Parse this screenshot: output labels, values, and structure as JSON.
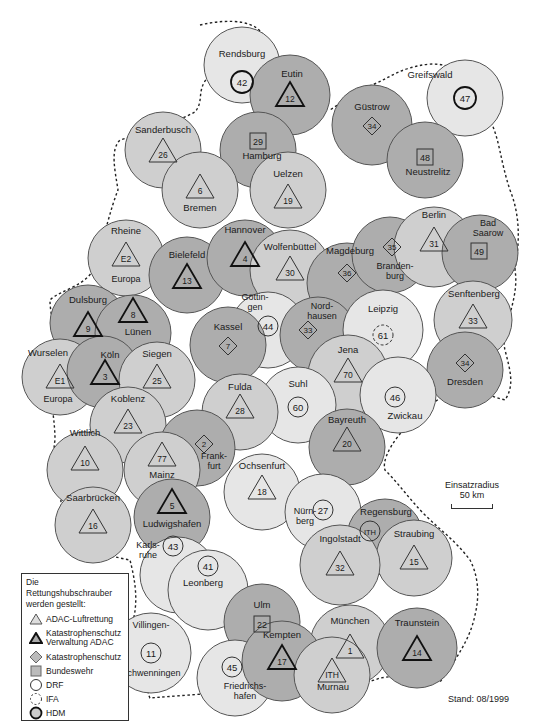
{
  "figure": {
    "title": "Die Rettungshubschrauber werden gestellt:",
    "stand": "Stand: 08/1999",
    "caption": "Figure 1",
    "scale": {
      "label": "Einsatzradius",
      "value": "50 km"
    }
  },
  "colors": {
    "light": "#e6e6e6",
    "medium": "#cfcfcf",
    "dark": "#adadad",
    "stroke": "#555555",
    "border_dashed": "#222222"
  },
  "legend": {
    "title_line1": "Die Rettungshubschrauber",
    "title_line2": "werden gestellt:",
    "items": [
      {
        "symbol": "triangle-thin",
        "label": "ADAC-Luftrettung"
      },
      {
        "symbol": "triangle-bold",
        "label": "Katastrophenschutz Verwaltung ADAC",
        "label1": "Katastrophenschutz",
        "label2": "Verwaltung ADAC"
      },
      {
        "symbol": "diamond",
        "label": "Katastrophenschutz"
      },
      {
        "symbol": "square",
        "label": "Bundeswehr"
      },
      {
        "symbol": "circle",
        "label": "DRF"
      },
      {
        "symbol": "circle-dashed",
        "label": "IFA"
      },
      {
        "symbol": "circle-bold",
        "label": "HDM"
      }
    ]
  },
  "stations": [
    {
      "name": "Rendsburg",
      "id": "42",
      "symbol": "circle-bold",
      "shade": "light",
      "cx": 242,
      "cy": 65,
      "r": 38,
      "lx": 242,
      "ly": 57,
      "sy": 82
    },
    {
      "name": "Eutin",
      "id": "12",
      "symbol": "triangle-bold",
      "shade": "dark",
      "cx": 290,
      "cy": 95,
      "r": 40,
      "lx": 292,
      "ly": 77,
      "sy": 98
    },
    {
      "name": "Hamburg",
      "id": "29",
      "symbol": "square",
      "shade": "dark",
      "cx": 258,
      "cy": 150,
      "r": 38,
      "lx": 262,
      "ly": 159,
      "sy": 141
    },
    {
      "name": "Greifswald",
      "id": "47",
      "symbol": "circle-bold",
      "shade": "light",
      "cx": 465,
      "cy": 98,
      "r": 38,
      "lx": 430,
      "ly": 78,
      "sy": 98,
      "lx2": 430
    },
    {
      "name": "Güstrow",
      "id": "34",
      "symbol": "diamond",
      "shade": "dark",
      "cx": 372,
      "cy": 125,
      "r": 40,
      "lx": 372,
      "ly": 110,
      "sy": 126
    },
    {
      "name": "Neustrelitz",
      "id": "48",
      "symbol": "square",
      "shade": "dark",
      "cx": 425,
      "cy": 160,
      "r": 38,
      "lx": 428,
      "ly": 175,
      "sy": 157
    },
    {
      "name": "Sanderbusch",
      "id": "26",
      "symbol": "triangle",
      "shade": "medium",
      "cx": 163,
      "cy": 150,
      "r": 38,
      "lx": 163,
      "ly": 133,
      "sy": 154
    },
    {
      "name": "Bremen",
      "id": "6",
      "symbol": "triangle",
      "shade": "medium",
      "cx": 200,
      "cy": 190,
      "r": 38,
      "lx": 200,
      "ly": 211,
      "sy": 190
    },
    {
      "name": "Uelzen",
      "id": "19",
      "symbol": "triangle",
      "shade": "medium",
      "cx": 288,
      "cy": 190,
      "r": 38,
      "lx": 288,
      "ly": 177,
      "sy": 200
    },
    {
      "name": "Rheine",
      "id": "E2",
      "symbol": "triangle",
      "shade": "medium",
      "cx": 126,
      "cy": 258,
      "r": 38,
      "lx": 126,
      "ly": 234,
      "sy": 258,
      "sub": "Europa",
      "suby": 282
    },
    {
      "name": "Bielefeld",
      "id": "13",
      "symbol": "triangle-bold",
      "shade": "dark",
      "cx": 187,
      "cy": 275,
      "r": 38,
      "lx": 187,
      "ly": 258,
      "sy": 280
    },
    {
      "name": "Hannover",
      "id": "4",
      "symbol": "triangle-bold",
      "shade": "dark",
      "cx": 245,
      "cy": 258,
      "r": 38,
      "lx": 245,
      "ly": 233,
      "sy": 258
    },
    {
      "name": "Wolfenbüttel",
      "id": "30",
      "symbol": "triangle",
      "shade": "medium",
      "cx": 290,
      "cy": 270,
      "r": 40,
      "lx": 290,
      "ly": 250,
      "sy": 272
    },
    {
      "name": "Magdeburg",
      "id": "36",
      "symbol": "diamond",
      "shade": "dark",
      "cx": 347,
      "cy": 283,
      "r": 40,
      "lx": 350,
      "ly": 254,
      "sy": 273
    },
    {
      "name": "Brandenburg",
      "id": "35",
      "symbol": "diamond",
      "shade": "dark",
      "cx": 390,
      "cy": 255,
      "r": 38,
      "lx": 395,
      "ly": 269,
      "sy": 247,
      "sx": 392,
      "multiline": [
        "Branden-",
        "burg"
      ]
    },
    {
      "name": "Berlin",
      "id": "31",
      "symbol": "triangle",
      "shade": "medium",
      "cx": 434,
      "cy": 247,
      "r": 40,
      "lx": 434,
      "ly": 218,
      "sy": 243
    },
    {
      "name": "Bad Saarow",
      "id": "49",
      "symbol": "square",
      "shade": "dark",
      "cx": 480,
      "cy": 253,
      "r": 38,
      "lx": 488,
      "ly": 226,
      "sy": 251,
      "sx": 479,
      "multiline": [
        "Bad",
        "Saarow"
      ]
    },
    {
      "name": "Dulsburg",
      "id": "9",
      "symbol": "triangle-bold",
      "shade": "dark",
      "cx": 88,
      "cy": 323,
      "r": 38,
      "lx": 88,
      "ly": 303,
      "sy": 328
    },
    {
      "name": "Lünen",
      "id": "8",
      "symbol": "triangle-bold",
      "shade": "dark",
      "cx": 133,
      "cy": 333,
      "r": 38,
      "lx": 138,
      "ly": 335,
      "sy": 314
    },
    {
      "name": "Göttingen",
      "id": "44",
      "symbol": "circle",
      "shade": "light",
      "cx": 268,
      "cy": 330,
      "r": 38,
      "lx": 255,
      "ly": 300,
      "sy": 326,
      "sx": 268,
      "multiline": [
        "Göttin-",
        "gen"
      ]
    },
    {
      "name": "Kassel",
      "id": "7",
      "symbol": "diamond",
      "shade": "dark",
      "cx": 228,
      "cy": 345,
      "r": 38,
      "lx": 228,
      "ly": 330,
      "sy": 346
    },
    {
      "name": "Nordhausen",
      "id": "33",
      "symbol": "diamond",
      "shade": "dark",
      "cx": 318,
      "cy": 335,
      "r": 38,
      "lx": 322,
      "ly": 309,
      "sy": 330,
      "sx": 308,
      "multiline": [
        "Nord-",
        "hausen"
      ]
    },
    {
      "name": "Leipzig",
      "id": "61",
      "symbol": "circle-dashed",
      "shade": "light",
      "cx": 383,
      "cy": 330,
      "r": 40,
      "lx": 383,
      "ly": 312,
      "sy": 335
    },
    {
      "name": "Senftenberg",
      "id": "33",
      "symbol": "triangle",
      "shade": "medium",
      "cx": 473,
      "cy": 320,
      "r": 39,
      "lx": 474,
      "ly": 297,
      "sy": 320
    },
    {
      "name": "Dresden",
      "id": "34",
      "symbol": "diamond",
      "shade": "dark",
      "cx": 465,
      "cy": 370,
      "r": 38,
      "lx": 465,
      "ly": 385,
      "sy": 363
    },
    {
      "name": "Wurselen",
      "id": "E1",
      "symbol": "triangle",
      "shade": "medium",
      "cx": 60,
      "cy": 377,
      "r": 38,
      "lx": 48,
      "ly": 356,
      "sy": 380,
      "sub": "Europa",
      "suby": 402,
      "subx": 58
    },
    {
      "name": "Köln",
      "id": "3",
      "symbol": "triangle-bold",
      "shade": "dark",
      "cx": 103,
      "cy": 372,
      "r": 36,
      "lx": 110,
      "ly": 358,
      "sy": 376,
      "sx": 105
    },
    {
      "name": "Siegen",
      "id": "25",
      "symbol": "triangle",
      "shade": "medium",
      "cx": 157,
      "cy": 380,
      "r": 38,
      "lx": 157,
      "ly": 357,
      "sy": 380
    },
    {
      "name": "Jena",
      "id": "70",
      "symbol": "triangle",
      "shade": "medium",
      "cx": 348,
      "cy": 375,
      "r": 40,
      "lx": 348,
      "ly": 353,
      "sy": 374
    },
    {
      "name": "Suhl",
      "id": "60",
      "symbol": "circle",
      "shade": "light",
      "cx": 298,
      "cy": 405,
      "r": 38,
      "lx": 298,
      "ly": 387,
      "sy": 407
    },
    {
      "name": "Fulda",
      "id": "28",
      "symbol": "triangle",
      "shade": "medium",
      "cx": 240,
      "cy": 412,
      "r": 38,
      "lx": 240,
      "ly": 390,
      "sy": 410
    },
    {
      "name": "Zwickau",
      "id": "46",
      "symbol": "circle",
      "shade": "light",
      "cx": 398,
      "cy": 395,
      "r": 38,
      "lx": 405,
      "ly": 419,
      "sy": 397,
      "sx": 395
    },
    {
      "name": "Koblenz",
      "id": "23",
      "symbol": "triangle",
      "shade": "medium",
      "cx": 128,
      "cy": 425,
      "r": 38,
      "lx": 128,
      "ly": 402,
      "sy": 425
    },
    {
      "name": "Frankfurt",
      "id": "2",
      "symbol": "diamond",
      "shade": "dark",
      "cx": 197,
      "cy": 448,
      "r": 38,
      "lx": 214,
      "ly": 459,
      "sy": 444,
      "sx": 204,
      "multiline": [
        "Frank-",
        "furt"
      ]
    },
    {
      "name": "Wittlich",
      "id": "10",
      "symbol": "triangle",
      "shade": "medium",
      "cx": 85,
      "cy": 470,
      "r": 38,
      "lx": 85,
      "ly": 436,
      "sy": 462
    },
    {
      "name": "Mainz",
      "id": "77",
      "symbol": "triangle",
      "shade": "medium",
      "cx": 162,
      "cy": 470,
      "r": 38,
      "lx": 162,
      "ly": 478,
      "sy": 458
    },
    {
      "name": "Bayreuth",
      "id": "20",
      "symbol": "triangle",
      "shade": "dark",
      "cx": 347,
      "cy": 447,
      "r": 38,
      "lx": 347,
      "ly": 423,
      "sy": 443
    },
    {
      "name": "Ochsenfurt",
      "id": "18",
      "symbol": "triangle",
      "shade": "light",
      "cx": 262,
      "cy": 492,
      "r": 38,
      "lx": 262,
      "ly": 469,
      "sy": 491
    },
    {
      "name": "Nürnberg",
      "id": "27",
      "symbol": "circle",
      "shade": "light",
      "cx": 323,
      "cy": 512,
      "r": 38,
      "lx": 305,
      "ly": 514,
      "sy": 510,
      "sx": 323,
      "multiline": [
        "Nürn-",
        "berg"
      ]
    },
    {
      "name": "Saarbrücken",
      "id": "16",
      "symbol": "triangle",
      "shade": "medium",
      "cx": 93,
      "cy": 525,
      "r": 38,
      "lx": 93,
      "ly": 501,
      "sy": 525
    },
    {
      "name": "Ludwigshafen",
      "id": "5",
      "symbol": "triangle-bold",
      "shade": "dark",
      "cx": 172,
      "cy": 517,
      "r": 38,
      "lx": 172,
      "ly": 527,
      "sy": 505
    },
    {
      "name": "Regensburg",
      "id": "ITH",
      "symbol": "circle",
      "shade": "dark",
      "cx": 385,
      "cy": 537,
      "r": 38,
      "lx": 386,
      "ly": 515,
      "sy": 531,
      "sx": 370
    },
    {
      "name": "Straubing",
      "id": "15",
      "symbol": "triangle",
      "shade": "medium",
      "cx": 414,
      "cy": 558,
      "r": 38,
      "lx": 414,
      "ly": 537,
      "sy": 561
    },
    {
      "name": "Ingolstadt",
      "id": "32",
      "symbol": "triangle",
      "shade": "medium",
      "cx": 340,
      "cy": 565,
      "r": 40,
      "lx": 340,
      "ly": 542,
      "sy": 567
    },
    {
      "name": "Karlsruhe",
      "id": "43",
      "symbol": "circle",
      "shade": "light",
      "cx": 178,
      "cy": 575,
      "r": 38,
      "lx": 148,
      "ly": 548,
      "sy": 546,
      "sx": 173,
      "multiline": [
        "Karls-",
        "ruhe"
      ]
    },
    {
      "name": "Leonberg",
      "id": "41",
      "symbol": "circle",
      "shade": "light",
      "cx": 208,
      "cy": 590,
      "r": 40,
      "lx": 203,
      "ly": 586,
      "sy": 566
    },
    {
      "name": "Ulm",
      "id": "22",
      "symbol": "square",
      "shade": "dark",
      "cx": 262,
      "cy": 622,
      "r": 38,
      "lx": 262,
      "ly": 608,
      "sy": 624
    },
    {
      "name": "Villingen-Schwenningen",
      "id": "11",
      "symbol": "circle",
      "shade": "light",
      "cx": 151,
      "cy": 653,
      "r": 40,
      "lx": 151,
      "ly": 628,
      "sy": 653,
      "multiline": [
        "Villingen-",
        "Schwenningen"
      ],
      "ml2y": 676
    },
    {
      "name": "München",
      "id": "1",
      "symbol": "triangle",
      "shade": "medium",
      "cx": 350,
      "cy": 645,
      "r": 40,
      "lx": 350,
      "ly": 624,
      "sy": 650
    },
    {
      "name": "Traunstein",
      "id": "14",
      "symbol": "triangle-bold",
      "shade": "dark",
      "cx": 417,
      "cy": 648,
      "r": 40,
      "lx": 417,
      "ly": 626,
      "sy": 652
    },
    {
      "name": "Friedrichshafen",
      "id": "45",
      "symbol": "circle",
      "shade": "light",
      "cx": 235,
      "cy": 678,
      "r": 38,
      "lx": 245,
      "ly": 689,
      "sy": 667,
      "sx": 232,
      "multiline": [
        "Friedrichs-",
        "hafen"
      ]
    },
    {
      "name": "Kempten",
      "id": "17",
      "symbol": "triangle-bold",
      "shade": "dark",
      "cx": 282,
      "cy": 661,
      "r": 40,
      "lx": 282,
      "ly": 638,
      "sy": 661
    },
    {
      "name": "Murnau",
      "id": "ITH",
      "symbol": "triangle",
      "shade": "medium",
      "cx": 332,
      "cy": 675,
      "r": 38,
      "lx": 333,
      "ly": 690,
      "sy": 674
    }
  ]
}
